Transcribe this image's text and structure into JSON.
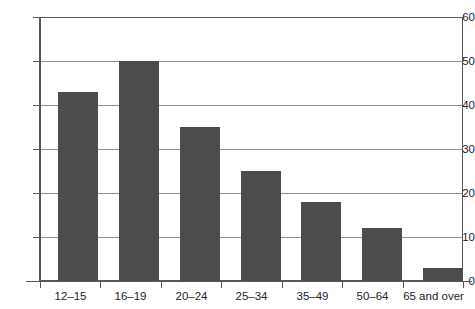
{
  "chart_data": {
    "type": "bar",
    "title": "",
    "subtitle": "",
    "xlabel": "",
    "ylabel": "",
    "categories": [
      "12–15",
      "16–19",
      "20–24",
      "25–34",
      "35–49",
      "50–64",
      "65 and over"
    ],
    "values": [
      43,
      50,
      35,
      25,
      18,
      12,
      3
    ],
    "ylim": [
      0,
      60
    ],
    "yticks": [
      0,
      10,
      20,
      30,
      40,
      50,
      60
    ],
    "ytick_labels": [
      "0",
      "10",
      "20",
      "30",
      "40",
      "50",
      "60"
    ],
    "grid": "horizontal",
    "legend": "none",
    "bar_color": "#4c4c4c",
    "grid_color": "#8d9093",
    "axis_color": "#56585a",
    "background": "#ffffff"
  }
}
